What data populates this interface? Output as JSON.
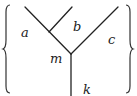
{
  "diagram": {
    "type": "trivalent-tree",
    "labels": {
      "a": "a",
      "b": "b",
      "c": "c",
      "m": "m",
      "k": "k"
    },
    "colors": {
      "stroke": "#222222",
      "background": "#ffffff"
    }
  }
}
